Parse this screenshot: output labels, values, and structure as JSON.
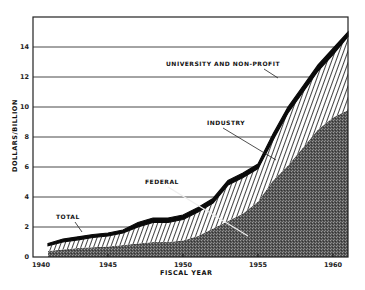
{
  "chart_data": {
    "type": "area",
    "stacked": true,
    "title": "",
    "xlabel": "FISCAL YEAR",
    "ylabel": "DOLLARS/BILLION",
    "xlim": [
      1940,
      1961
    ],
    "ylim": [
      0,
      16
    ],
    "x_ticks": [
      "1940",
      "1945",
      "1950",
      "1955",
      "1960"
    ],
    "y_ticks": [
      "0",
      "2",
      "4",
      "6",
      "8",
      "10",
      "12",
      "14"
    ],
    "grid": "horizontal",
    "x": [
      1941,
      1942,
      1943,
      1944,
      1945,
      1946,
      1947,
      1948,
      1949,
      1950,
      1951,
      1952,
      1953,
      1954,
      1955,
      1956,
      1957,
      1958,
      1959,
      1960,
      1961
    ],
    "series": [
      {
        "name": "FEDERAL",
        "fill": "stippled dark gray",
        "values": [
          0.4,
          0.5,
          0.6,
          0.65,
          0.7,
          0.8,
          0.9,
          1.0,
          1.0,
          1.1,
          1.4,
          1.9,
          2.4,
          2.9,
          3.7,
          5.1,
          6.1,
          7.3,
          8.5,
          9.3,
          9.8
        ]
      },
      {
        "name": "INDUSTRY",
        "fill": "diagonal hatch",
        "values": [
          0.35,
          0.5,
          0.55,
          0.65,
          0.7,
          0.8,
          1.1,
          1.3,
          1.3,
          1.4,
          1.6,
          1.7,
          2.4,
          2.4,
          2.2,
          2.7,
          3.5,
          3.7,
          3.9,
          4.2,
          4.9
        ]
      },
      {
        "name": "UNIVERSITY AND NON-PROFIT",
        "fill": "solid black",
        "values": [
          0.15,
          0.2,
          0.2,
          0.2,
          0.2,
          0.2,
          0.3,
          0.3,
          0.3,
          0.3,
          0.3,
          0.3,
          0.3,
          0.3,
          0.3,
          0.4,
          0.4,
          0.4,
          0.4,
          0.4,
          0.3
        ]
      }
    ],
    "total": [
      0.9,
      1.2,
      1.35,
      1.5,
      1.6,
      1.8,
      2.3,
      2.6,
      2.6,
      2.8,
      3.3,
      3.9,
      5.1,
      5.6,
      6.2,
      8.2,
      10.0,
      11.4,
      12.8,
      13.9,
      15.0
    ],
    "annotations": [
      "UNIVERSITY AND NON-PROFIT",
      "INDUSTRY",
      "FEDERAL",
      "TOTAL"
    ]
  },
  "labels": {
    "y_axis": "DOLLARS/BILLION",
    "x_axis": "FISCAL YEAR",
    "university": "UNIVERSITY AND NON-PROFIT",
    "industry": "INDUSTRY",
    "federal": "FEDERAL",
    "total": "TOTAL"
  }
}
